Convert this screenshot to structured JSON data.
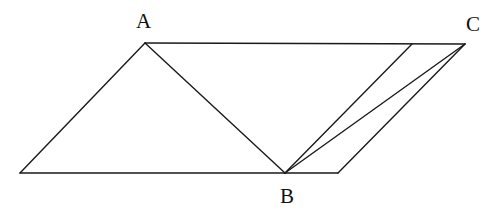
{
  "diagram": {
    "type": "geometry",
    "stroke_color": "#1a1a1a",
    "points": {
      "A": {
        "label": "A",
        "x": 145,
        "y": 43,
        "label_x": 136,
        "label_y": 28
      },
      "C": {
        "label": "C",
        "x": 465,
        "y": 44,
        "label_x": 466,
        "label_y": 31
      },
      "B": {
        "label": "B",
        "x": 285,
        "y": 173,
        "label_x": 280,
        "label_y": 203
      },
      "P_bottom_left": {
        "label": "",
        "x": 20,
        "y": 173
      },
      "P_bottom_right": {
        "label": "",
        "x": 338,
        "y": 173
      },
      "P_top_inner": {
        "label": "",
        "x": 412,
        "y": 44
      }
    },
    "segments": [
      {
        "id": "A-C",
        "from": "A",
        "to": "C"
      },
      {
        "id": "A-bottom-left",
        "from": "A",
        "to": "P_bottom_left"
      },
      {
        "id": "bottom-left-B",
        "from": "P_bottom_left",
        "to": "B"
      },
      {
        "id": "B-bottom-right",
        "from": "B",
        "to": "P_bottom_right"
      },
      {
        "id": "bottom-right-C",
        "from": "P_bottom_right",
        "to": "C"
      },
      {
        "id": "A-B",
        "from": "A",
        "to": "B"
      },
      {
        "id": "B-C",
        "from": "B",
        "to": "C"
      },
      {
        "id": "B-top-inner",
        "from": "B",
        "to": "P_top_inner"
      }
    ]
  }
}
